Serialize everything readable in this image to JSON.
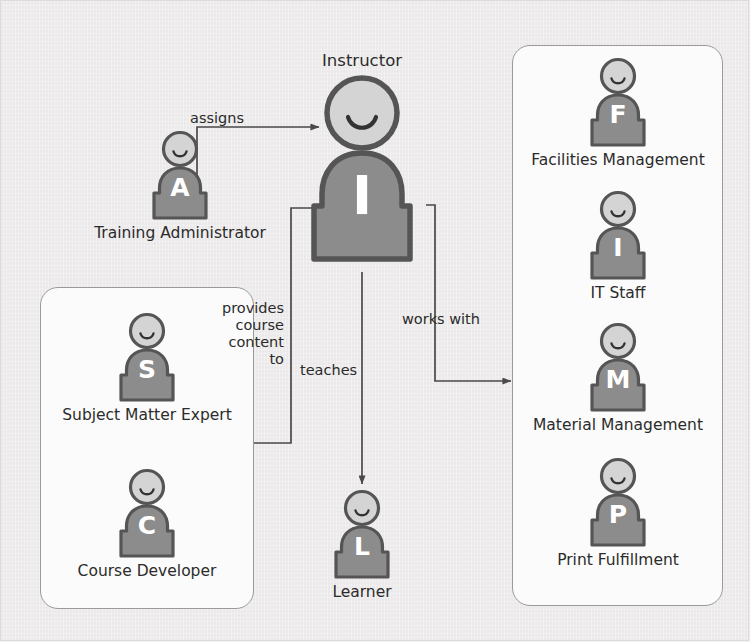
{
  "diagram": {
    "background_color": "#eeecec",
    "figure_body_color": "#8c8c8c",
    "figure_outline_color": "#555555",
    "figure_head_color": "#d9d9d9",
    "connector_color": "#4a4a4a",
    "group_box_border_color": "#9a9a9a"
  },
  "actors": {
    "training_administrator": {
      "initial": "A",
      "label": "Training Administrator"
    },
    "instructor": {
      "initial": "I",
      "label": "Instructor"
    },
    "subject_matter_expert": {
      "initial": "S",
      "label": "Subject Matter Expert"
    },
    "course_developer": {
      "initial": "C",
      "label": "Course Developer"
    },
    "learner": {
      "initial": "L",
      "label": "Learner"
    },
    "facilities_management": {
      "initial": "F",
      "label": "Facilities Management"
    },
    "it_staff": {
      "initial": "I",
      "label": "IT Staff"
    },
    "material_management": {
      "initial": "M",
      "label": "Material Management"
    },
    "print_fulfillment": {
      "initial": "P",
      "label": "Print Fulfillment"
    }
  },
  "connectors": {
    "assigns": "assigns",
    "provides_course_content_to": "provides\ncourse\ncontent\nto",
    "teaches": "teaches",
    "works_with": "works with"
  }
}
